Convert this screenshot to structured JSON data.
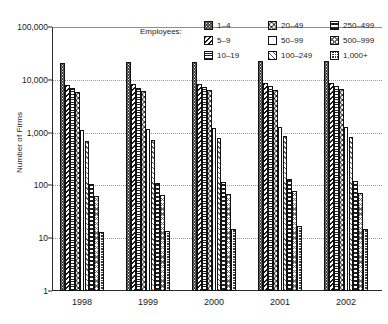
{
  "chart_data": {
    "type": "bar",
    "title": "",
    "xlabel": "",
    "ylabel": "Number of Firms",
    "categories": [
      "1998",
      "1999",
      "2000",
      "2001",
      "2002"
    ],
    "ylim": [
      1,
      100000
    ],
    "yscale": "log",
    "yticks": [
      "1",
      "10",
      "100",
      "1,000",
      "10,000",
      "100,000"
    ],
    "ytick_values": [
      1,
      10,
      100,
      1000,
      10000,
      100000
    ],
    "grid": true,
    "legend_position": "top-right",
    "legend_title": "Employees:",
    "series": [
      {
        "name": "1–4",
        "pattern": "p-dots",
        "values": [
          21000,
          21500,
          22000,
          22500,
          23000
        ]
      },
      {
        "name": "5–9",
        "pattern": "p-backslash",
        "values": [
          8000,
          8200,
          8400,
          8600,
          8800
        ]
      },
      {
        "name": "10–19",
        "pattern": "p-hlines",
        "values": [
          7000,
          7100,
          7300,
          7500,
          7600
        ]
      },
      {
        "name": "20–49",
        "pattern": "p-bigdot",
        "values": [
          6000,
          6100,
          6300,
          6500,
          6600
        ]
      },
      {
        "name": "50–99",
        "pattern": "p-empty",
        "values": [
          1100,
          1150,
          1200,
          1300,
          1300
        ]
      },
      {
        "name": "100–249",
        "pattern": "p-slash-lt",
        "values": [
          700,
          730,
          780,
          880,
          820
        ]
      },
      {
        "name": "250–499",
        "pattern": "p-thick-h",
        "values": [
          105,
          110,
          115,
          130,
          120
        ]
      },
      {
        "name": "500–999",
        "pattern": "p-cross",
        "values": [
          62,
          65,
          68,
          78,
          72
        ]
      },
      {
        "name": "1,000+",
        "pattern": "p-check",
        "values": [
          13,
          14,
          15,
          17,
          15
        ]
      }
    ]
  }
}
